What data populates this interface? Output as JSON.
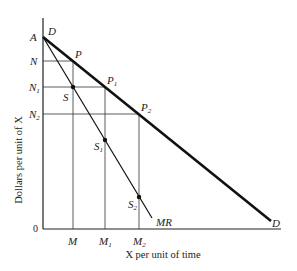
{
  "diagram": {
    "type": "economics-demand-marginal-revenue",
    "x_axis_title": "X per unit of time",
    "y_axis_title": "Dollars per unit of X",
    "origin_label": "0",
    "curves": {
      "demand": {
        "label_start": "D",
        "label_end": "D"
      },
      "marginal_revenue": {
        "label": "MR"
      }
    },
    "intercept_label": "A",
    "price_levels": [
      {
        "base": "N",
        "sub": ""
      },
      {
        "base": "N",
        "sub": "1"
      },
      {
        "base": "N",
        "sub": "2"
      }
    ],
    "quantities": [
      {
        "base": "M",
        "sub": ""
      },
      {
        "base": "M",
        "sub": "1"
      },
      {
        "base": "M",
        "sub": "2"
      }
    ],
    "demand_points": [
      {
        "base": "P",
        "sub": ""
      },
      {
        "base": "P",
        "sub": "1"
      },
      {
        "base": "P",
        "sub": "2"
      }
    ],
    "mr_points": [
      {
        "base": "S",
        "sub": ""
      },
      {
        "base": "S",
        "sub": "1"
      },
      {
        "base": "S",
        "sub": "2"
      }
    ],
    "colors": {
      "line": "#111111",
      "guide": "#333333"
    }
  }
}
